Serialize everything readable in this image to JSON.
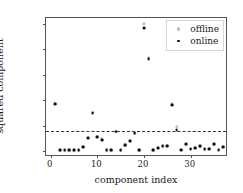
{
  "chart_data": {
    "type": "scatter",
    "title": "",
    "xlabel": "component index",
    "ylabel": "squared component",
    "xlim": [
      -1,
      38
    ],
    "ylim": [
      -0.012,
      0.262
    ],
    "xticks": [
      0,
      10,
      20,
      30
    ],
    "xticklabels": [
      "0",
      "10",
      "20",
      "30"
    ],
    "yticks": [
      0.0,
      0.05,
      0.1,
      0.15,
      0.2,
      0.25
    ],
    "yticklabels": [
      "0.00",
      "0.05",
      "0.10",
      "0.15",
      "0.20",
      "0.25"
    ],
    "grid": false,
    "legend_position": "upper right",
    "threshold": {
      "value": 0.04,
      "style": "dashed",
      "color": "#333333"
    },
    "series": [
      {
        "name": "offline",
        "color": "#bdbdbd",
        "marker": "circle",
        "x": [
          1,
          2,
          3,
          4,
          5,
          6,
          7,
          8,
          9,
          10,
          11,
          12,
          13,
          14,
          15,
          16,
          17,
          18,
          19,
          20,
          21,
          22,
          23,
          24,
          25,
          26,
          27,
          28,
          29,
          30,
          31,
          32,
          33,
          34,
          35,
          36,
          37
        ],
        "y": [
          0.093,
          0.001,
          0.001,
          0.001,
          0.001,
          0.001,
          0.008,
          0.026,
          0.075,
          0.028,
          0.023,
          0.001,
          0.001,
          0.038,
          0.001,
          0.011,
          0.02,
          0.035,
          0.001,
          0.25,
          0.183,
          0.001,
          0.006,
          0.009,
          0.01,
          0.092,
          0.048,
          0.002,
          0.013,
          0.004,
          0.006,
          0.009,
          0.003,
          0.004,
          0.013,
          0.002,
          0.008
        ]
      },
      {
        "name": "online",
        "color": "#111111",
        "marker": "circle",
        "x": [
          1,
          2,
          3,
          4,
          5,
          6,
          7,
          8,
          9,
          10,
          11,
          12,
          13,
          14,
          15,
          16,
          17,
          18,
          19,
          20,
          21,
          22,
          23,
          24,
          25,
          26,
          27,
          28,
          29,
          30,
          31,
          32,
          33,
          34,
          35,
          36,
          37
        ],
        "y": [
          0.093,
          0.001,
          0.001,
          0.001,
          0.001,
          0.001,
          0.008,
          0.026,
          0.075,
          0.028,
          0.022,
          0.001,
          0.001,
          0.038,
          0.001,
          0.011,
          0.02,
          0.035,
          0.001,
          0.242,
          0.181,
          0.001,
          0.006,
          0.009,
          0.01,
          0.09,
          0.041,
          0.002,
          0.013,
          0.004,
          0.006,
          0.009,
          0.003,
          0.004,
          0.013,
          0.002,
          0.008
        ]
      }
    ],
    "legend": [
      {
        "label": "offline",
        "marker_name": "offline-marker-icon"
      },
      {
        "label": "online",
        "marker_name": "online-marker-icon"
      }
    ]
  }
}
